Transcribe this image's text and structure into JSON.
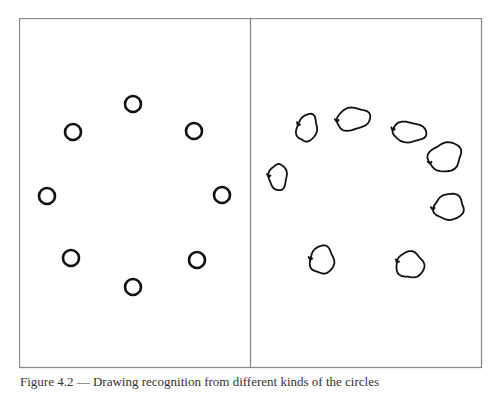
{
  "figure": {
    "caption": "Figure 4.2 — Drawing recognition from different kinds of the circles",
    "border_color": "#8a8a8a",
    "stroke_color": "#111111",
    "panels": [
      {
        "id": "left",
        "label": "Ideal circles",
        "shape_count": 8,
        "circles": [
          {
            "cx": 133,
            "cy": 104,
            "r": 8
          },
          {
            "cx": 73,
            "cy": 132,
            "r": 8
          },
          {
            "cx": 194,
            "cy": 131,
            "r": 8
          },
          {
            "cx": 47,
            "cy": 196,
            "r": 8
          },
          {
            "cx": 222,
            "cy": 195,
            "r": 8
          },
          {
            "cx": 71,
            "cy": 258,
            "r": 8
          },
          {
            "cx": 197,
            "cy": 260,
            "r": 8
          },
          {
            "cx": 133,
            "cy": 287,
            "r": 8
          }
        ]
      },
      {
        "id": "right",
        "label": "Hand-drawn circles",
        "shape_count": 8,
        "circles": [
          {
            "cx": 307,
            "cy": 128,
            "rx": 10,
            "ry": 14,
            "rot": 15
          },
          {
            "cx": 353,
            "cy": 119,
            "rx": 17,
            "ry": 11,
            "rot": -10
          },
          {
            "cx": 409,
            "cy": 132,
            "rx": 17,
            "ry": 10,
            "rot": 5
          },
          {
            "cx": 445,
            "cy": 157,
            "rx": 17,
            "ry": 14,
            "rot": -25
          },
          {
            "cx": 278,
            "cy": 177,
            "rx": 9,
            "ry": 13,
            "rot": 0
          },
          {
            "cx": 449,
            "cy": 207,
            "rx": 15,
            "ry": 13,
            "rot": -10
          },
          {
            "cx": 322,
            "cy": 260,
            "rx": 12,
            "ry": 14,
            "rot": 0
          },
          {
            "cx": 410,
            "cy": 265,
            "rx": 14,
            "ry": 13,
            "rot": 10
          }
        ]
      }
    ]
  }
}
